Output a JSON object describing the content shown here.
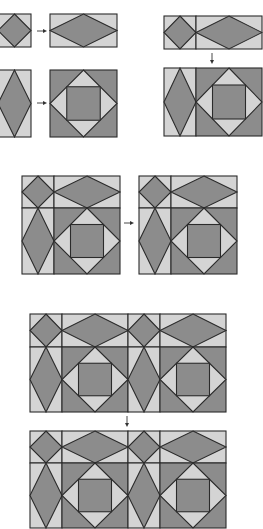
{
  "diagram": {
    "colors": {
      "dark": "#8c8c8c",
      "light": "#d4d4d4",
      "stroke": "#2b2b2b",
      "background": "#ffffff",
      "arrow": "#333333"
    },
    "units": {
      "diamond_square": "small square unit with dark diamond",
      "flying_rect": "wide rectangle with dark horizontal diamond",
      "tall_diamond": "tall rectangle with dark vertical diamond",
      "square_in_square": "large square with light diamond and dark center square"
    },
    "steps": [
      {
        "id": "step1a",
        "description": "Join small diamond square to wide diamond rectangle",
        "arrow": "right"
      },
      {
        "id": "step1b",
        "description": "Join tall diamond rectangle to square-in-square block",
        "arrow": "right"
      },
      {
        "id": "step2",
        "description": "Join top row to bottom row",
        "arrow": "down"
      },
      {
        "id": "step3",
        "description": "Completed block repeated",
        "arrow": "right"
      },
      {
        "id": "step4",
        "description": "Join two-block rows vertically",
        "arrow": "down"
      }
    ]
  }
}
